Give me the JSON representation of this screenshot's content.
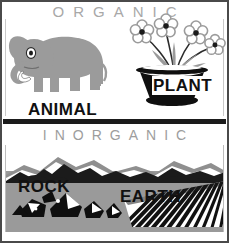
{
  "poster": {
    "title_top": "ORGANIC",
    "title_bottom": "INORGANIC",
    "labels": {
      "animal": "ANIMAL",
      "plant": "PLANT",
      "rock": "ROCK",
      "earth": "EARTH"
    },
    "colors": {
      "background": "#ffffff",
      "heading_gray": "#a8a8a8",
      "label_black": "#111111",
      "elephant_gray": "#9b9b9b",
      "ground_gray": "#9a9a9a",
      "mountain_black": "#1b1b1b",
      "mountain_gray": "#8f8f8f",
      "divider_black": "#1b1b1b",
      "frame_gray": "#4a4a4a"
    },
    "illustrations": {
      "organic": [
        "elephant-illustration",
        "potted-flowers-illustration"
      ],
      "inorganic": [
        "mountain-range-illustration",
        "rock-pile-illustration",
        "plowed-field-illustration"
      ]
    },
    "flower_count": 4
  }
}
